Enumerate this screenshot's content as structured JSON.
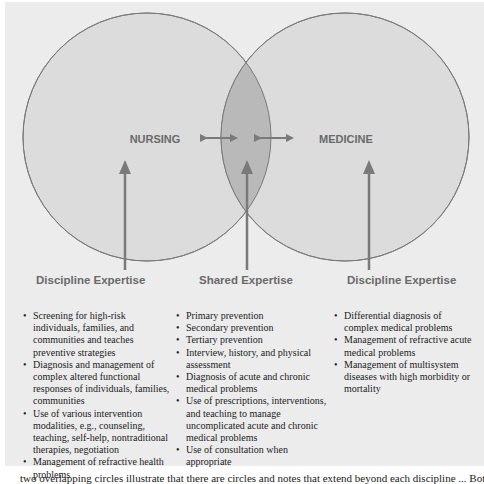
{
  "diagram": {
    "type": "venn",
    "circles": [
      {
        "label": "NURSING"
      },
      {
        "label": "MEDICINE"
      }
    ],
    "colors": {
      "background": "#ececec",
      "circle_fill": "#dcdcdc",
      "overlap_fill": "#b9b9b9",
      "stroke": "#7a7a7a",
      "arrow": "#7a7a7a",
      "heading_text": "#6a6a6a"
    }
  },
  "columns": [
    {
      "heading": "Discipline Expertise",
      "items": [
        "Screening for high-risk individuals, families, and communities and teaches preventive strategies",
        "Diagnosis and management of complex altered functional responses of individuals, families, communities",
        "Use of various intervention modalities, e.g., counseling, teaching, self-help, nontraditional therapies, negotiation",
        "Management of refractive health problems"
      ]
    },
    {
      "heading": "Shared Expertise",
      "items": [
        "Primary prevention",
        "Secondary prevention",
        "Tertiary prevention",
        "Interview, history, and physical assessment",
        "Diagnosis of acute and chronic medical problems",
        "Use of prescriptions, interventions, and teaching to manage uncomplicated acute and chronic medical problems",
        "Use of consultation when appropriate"
      ]
    },
    {
      "heading": "Discipline Expertise",
      "items": [
        "Differential diagnosis of complex medical problems",
        "Management of refractive acute medical problems",
        "Management of multisystem diseases with high morbidity or mortality"
      ]
    }
  ],
  "footer_text": "two overlapping circles illustrate that there are circles and notes that extend beyond each discipline ... Bot"
}
